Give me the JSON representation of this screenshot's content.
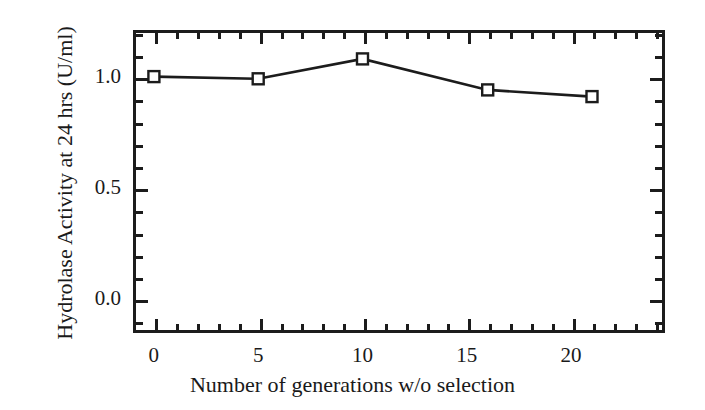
{
  "figure": {
    "background_color": "#ffffff",
    "ink_color": "#1c1c1c"
  },
  "chart_data": {
    "type": "line",
    "title": "",
    "subtitle": "",
    "xlabel": "Number of generations w/o selection",
    "ylabel": "Hydrolase Activity at 24 hrs  (U/ml)",
    "xlim": [
      -1.0,
      24.5
    ],
    "ylim": [
      -0.155,
      1.21
    ],
    "grid": false,
    "legend": null,
    "legend_position": "none",
    "xticks": [
      0,
      5,
      10,
      15,
      20
    ],
    "xtick_labels": [
      "0",
      "5",
      "10",
      "15",
      "20"
    ],
    "xminor_interval": 1,
    "yticks": [
      0.0,
      0.5,
      1.0
    ],
    "ytick_labels": [
      "0.0",
      "0.5",
      "1.0"
    ],
    "yminor_interval": 0.1,
    "marker": "open-square",
    "marker_face_color": "#ffffff",
    "marker_edge_color": "#1c1c1c",
    "line_color": "#1c1c1c",
    "line_width": 2.6,
    "x": [
      0,
      5,
      10,
      16,
      21
    ],
    "y": [
      1.0,
      0.99,
      1.08,
      0.94,
      0.91
    ],
    "series": [
      {
        "name": "Hydrolase activity",
        "x": [
          0,
          5,
          10,
          16,
          21
        ],
        "values": [
          1.0,
          0.99,
          1.08,
          0.94,
          0.91
        ]
      }
    ],
    "annotations": []
  }
}
